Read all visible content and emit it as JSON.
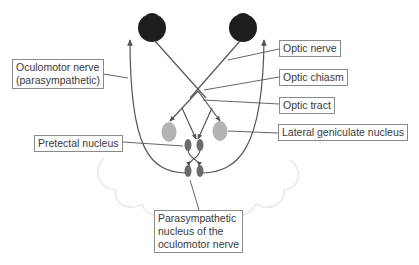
{
  "diagram": {
    "colors": {
      "eye": "#1e1e1e",
      "nerve_line": "#555555",
      "lgn": "#b4b4b4",
      "nucleus": "#6b6b6b",
      "cloud": "#e6e6e6",
      "label_border": "#8a8a8a",
      "label_text": "#3a3a3a"
    },
    "labels": {
      "oculomotor_nerve": "Oculomotor nerve\n(parasympathetic)",
      "optic_nerve": "Optic nerve",
      "optic_chiasm": "Optic chiasm",
      "optic_tract": "Optic tract",
      "lateral_geniculate_nucleus": "Lateral geniculate nucleus",
      "pretectal_nucleus": "Pretectal nucleus",
      "parasympathetic_nucleus": "Parasympathetic\nnucleus of the\noculomotor nerve"
    },
    "nodes": [
      {
        "name": "left-eye",
        "type": "eye"
      },
      {
        "name": "right-eye",
        "type": "eye"
      },
      {
        "name": "optic-chiasm",
        "type": "crossing"
      },
      {
        "name": "left-lateral-geniculate-nucleus",
        "type": "nucleus"
      },
      {
        "name": "right-lateral-geniculate-nucleus",
        "type": "nucleus"
      },
      {
        "name": "left-pretectal-nucleus",
        "type": "nucleus"
      },
      {
        "name": "right-pretectal-nucleus",
        "type": "nucleus"
      },
      {
        "name": "left-edinger-westphal-nucleus",
        "type": "nucleus"
      },
      {
        "name": "right-edinger-westphal-nucleus",
        "type": "nucleus"
      }
    ],
    "edges": [
      {
        "from": "left-eye",
        "to": "optic-chiasm",
        "label": "Optic nerve"
      },
      {
        "from": "right-eye",
        "to": "optic-chiasm",
        "label": "Optic nerve"
      },
      {
        "from": "optic-chiasm",
        "to": "left-lateral-geniculate-nucleus",
        "label": "Optic tract"
      },
      {
        "from": "optic-chiasm",
        "to": "right-lateral-geniculate-nucleus",
        "label": "Optic tract"
      },
      {
        "from": "optic-chiasm",
        "to": "left-pretectal-nucleus"
      },
      {
        "from": "optic-chiasm",
        "to": "right-pretectal-nucleus"
      },
      {
        "from": "left-pretectal-nucleus",
        "to": "right-edinger-westphal-nucleus"
      },
      {
        "from": "right-pretectal-nucleus",
        "to": "left-edinger-westphal-nucleus"
      },
      {
        "from": "left-edinger-westphal-nucleus",
        "to": "left-eye",
        "label": "Oculomotor nerve (parasympathetic)"
      },
      {
        "from": "right-edinger-westphal-nucleus",
        "to": "right-eye",
        "label": "Oculomotor nerve (parasympathetic)"
      }
    ]
  }
}
